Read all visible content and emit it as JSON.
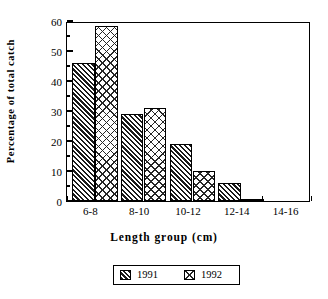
{
  "chart_data": {
    "type": "bar",
    "title": "",
    "subtitle": "",
    "xlabel": "Length group (cm)",
    "ylabel": "Percentage of total catch",
    "categories": [
      "6-8",
      "8-10",
      "10-12",
      "12-14",
      "14-16"
    ],
    "series": [
      {
        "name": "1991",
        "values": [
          46,
          29,
          19,
          6,
          0
        ]
      },
      {
        "name": "1992",
        "values": [
          58.5,
          31,
          10,
          0.7,
          0
        ]
      }
    ],
    "ylim": [
      0,
      60
    ],
    "yticks": [
      0,
      10,
      20,
      30,
      40,
      50,
      60
    ],
    "ytick_labels": [
      "0",
      "10",
      "20",
      "30",
      "40",
      "50",
      "60"
    ],
    "yminor_ticks": [
      5,
      15,
      25,
      35,
      45,
      55
    ],
    "grid": false,
    "legend_position": "bottom-outside",
    "legend_entries": [
      {
        "label": "1991",
        "pattern": "dense-diagonal-hatch"
      },
      {
        "label": "1992",
        "pattern": "sparse-crosshatch"
      }
    ],
    "colors": {
      "axis": "#000000",
      "background": "#ffffff",
      "series_1991": "#1a1a1a",
      "series_1992": "#262626"
    }
  }
}
